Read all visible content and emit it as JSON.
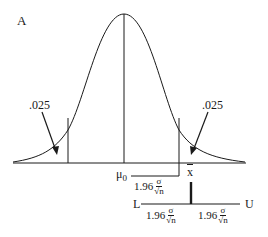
{
  "figure": {
    "panel_label": "A",
    "tail_left_label": ".025",
    "tail_right_label": ".025",
    "center_label": "μ",
    "center_subscript": "0",
    "sample_mean_label": "x",
    "lower_bound_label": "L",
    "upper_bound_label": "U",
    "margin": {
      "coefficient": "1.96",
      "numerator": "σ",
      "denominator": "√n"
    }
  },
  "colors": {
    "ink": "#1a1a1a",
    "background": "#ffffff"
  }
}
